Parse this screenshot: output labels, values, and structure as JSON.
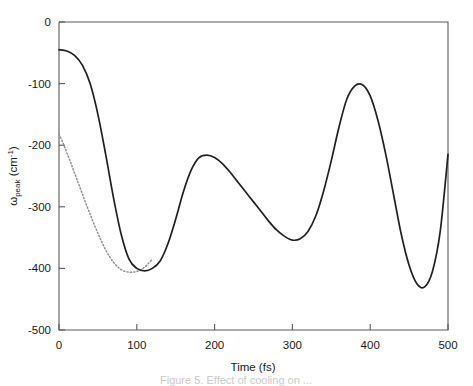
{
  "chart_data": {
    "type": "line",
    "title": "",
    "xlabel": "Time (fs)",
    "ylabel": "ωpeak (cm-1)",
    "ylabel_parts": {
      "symbol": "ω",
      "subscript": "peak",
      "unit_open": " (cm",
      "unit_sup": "-1",
      "unit_close": ")"
    },
    "xlim": [
      0,
      500
    ],
    "ylim": [
      -500,
      0
    ],
    "xticks": [
      0,
      100,
      200,
      300,
      400,
      500
    ],
    "yticks": [
      0,
      -100,
      -200,
      -300,
      -400,
      -500
    ],
    "xtick_labels": [
      "0",
      "100",
      "200",
      "300",
      "400",
      "500"
    ],
    "ytick_labels": [
      "0",
      "-100",
      "-200",
      "-300",
      "-400",
      "-500"
    ],
    "grid": false,
    "legend": "none",
    "series": [
      {
        "name": "solid-curve",
        "style": "solid",
        "color": "#231f20",
        "x": [
          0,
          10,
          20,
          30,
          40,
          50,
          60,
          70,
          80,
          90,
          100,
          110,
          120,
          130,
          140,
          150,
          160,
          170,
          180,
          190,
          200,
          210,
          220,
          230,
          240,
          250,
          260,
          270,
          280,
          290,
          300,
          310,
          320,
          330,
          340,
          350,
          360,
          370,
          380,
          390,
          400,
          410,
          420,
          430,
          440,
          450,
          460,
          470,
          480,
          490,
          500
        ],
        "y": [
          -45,
          -47,
          -54,
          -70,
          -100,
          -150,
          -215,
          -285,
          -345,
          -385,
          -400,
          -404,
          -400,
          -388,
          -360,
          -320,
          -275,
          -240,
          -220,
          -216,
          -220,
          -230,
          -244,
          -260,
          -276,
          -292,
          -308,
          -324,
          -338,
          -348,
          -354,
          -352,
          -340,
          -315,
          -275,
          -225,
          -170,
          -125,
          -104,
          -102,
          -120,
          -160,
          -215,
          -280,
          -345,
          -395,
          -425,
          -430,
          -405,
          -340,
          -215
        ]
      },
      {
        "name": "dotted-curve",
        "style": "dotted",
        "color": "#8d8d8d",
        "x": [
          0,
          5,
          10,
          15,
          20,
          25,
          30,
          35,
          40,
          45,
          50,
          55,
          60,
          65,
          70,
          75,
          80,
          85,
          90,
          95,
          100,
          105,
          110,
          115,
          120
        ],
        "y": [
          -182,
          -196,
          -212,
          -228,
          -245,
          -262,
          -279,
          -296,
          -312,
          -328,
          -343,
          -357,
          -370,
          -381,
          -390,
          -397,
          -402,
          -405,
          -406,
          -406,
          -405,
          -402,
          -398,
          -392,
          -385
        ]
      }
    ],
    "annotations": {
      "first_minimum": {
        "x": 110,
        "y": -404
      },
      "first_maximum": {
        "x": 190,
        "y": -216
      },
      "second_minimum": {
        "x": 300,
        "y": -354
      },
      "second_maximum": {
        "x": 390,
        "y": -102
      },
      "third_minimum": {
        "x": 470,
        "y": -430
      },
      "start_solid": {
        "x": 0,
        "y": -45
      },
      "start_dotted": {
        "x": 0,
        "y": -182
      },
      "end": {
        "x": 500,
        "y": -215
      }
    }
  },
  "caption": {
    "text": "Figure 5. Effect of cooling on ...",
    "visible": "partial"
  }
}
